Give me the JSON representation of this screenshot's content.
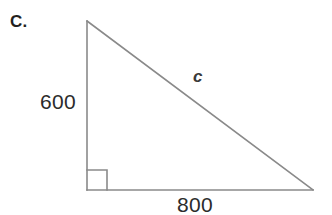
{
  "figure": {
    "item_label": "C.",
    "shape": "right-triangle",
    "vertices": {
      "apex": [
        87,
        21
      ],
      "right_angle_corner": [
        87,
        190
      ],
      "far_corner": [
        313,
        190
      ]
    },
    "right_angle_marker_size": 20,
    "stroke_color": "#8a8a8a",
    "background_color": "#ffffff",
    "labels": {
      "vertical_leg": "600",
      "horizontal_leg": "800",
      "hypotenuse": "c"
    }
  }
}
